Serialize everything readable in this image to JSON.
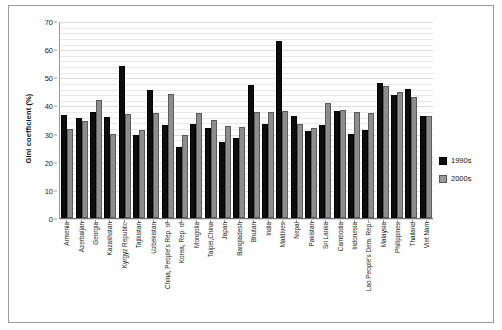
{
  "chart_data": {
    "type": "bar",
    "title": "",
    "xlabel": "",
    "ylabel": "Gini coefficient (%)",
    "ylim": [
      0,
      70
    ],
    "yticks": [
      0,
      10,
      20,
      30,
      40,
      50,
      60,
      70
    ],
    "grid": true,
    "legend_position": "right",
    "categories": [
      "Armenia",
      "Azerbaijan",
      "Georgia",
      "Kazakhstan",
      "Kyrgyz Republic",
      "Tajikistan",
      "Uzbekistan",
      "China, People's Rep. of",
      "Korea, Rep. of",
      "Mongolia",
      "Taipei,China",
      "Japan",
      "Bangladesh",
      "Bhutan",
      "India",
      "Maldives",
      "Nepal",
      "Pakistan",
      "Sri Lanka",
      "Cambodia",
      "Indonesia",
      "Lao People's Dem. Rep.",
      "Malaysia",
      "Philippines",
      "Thailand",
      "Viet Nam"
    ],
    "series": [
      {
        "name": "1990s",
        "color": "#0d0d0d",
        "values": [
          35.8,
          34.8,
          37.1,
          35.3,
          53.3,
          28.8,
          44.9,
          32.2,
          24.5,
          32.8,
          31.1,
          26.3,
          27.6,
          46.5,
          32.6,
          62.1,
          35.6,
          30.3,
          32.5,
          37.3,
          29.2,
          30.4,
          47.3,
          42.9,
          45.3,
          35.5
        ]
      },
      {
        "name": "2000s",
        "color": "#8d8d8d",
        "values": [
          31.0,
          33.8,
          41.3,
          29.0,
          36.2,
          30.7,
          36.7,
          43.4,
          28.7,
          36.5,
          34.1,
          31.9,
          31.8,
          36.9,
          37.0,
          37.4,
          32.8,
          31.2,
          40.3,
          37.6,
          37.1,
          36.7,
          46.2,
          44.0,
          42.4,
          35.6
        ]
      }
    ]
  },
  "legend": {
    "items": [
      {
        "label": "1990s"
      },
      {
        "label": "2000s"
      }
    ]
  }
}
